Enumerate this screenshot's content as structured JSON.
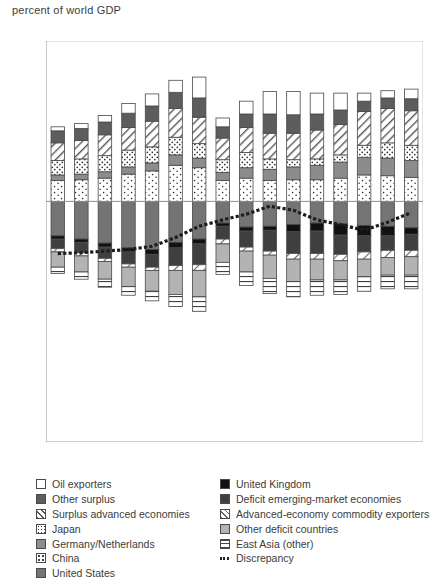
{
  "axis_title": "percent of world GDP",
  "legend": {
    "left": [
      {
        "label": "Oil exporters",
        "swatch": "oil-exporters-swatch",
        "cls": "sw-oil"
      },
      {
        "label": "Other surplus",
        "swatch": "other-surplus-swatch",
        "cls": "sw-othersurplus"
      },
      {
        "label": "Surplus advanced economies",
        "swatch": "surplus-advanced-economies-swatch",
        "cls": "sw-surpadv"
      },
      {
        "label": "Japan",
        "swatch": "japan-swatch",
        "cls": "sw-japan"
      },
      {
        "label": "Germany/Netherlands",
        "swatch": "germany-netherlands-swatch",
        "cls": "sw-germany"
      },
      {
        "label": "China",
        "swatch": "china-swatch",
        "cls": "sw-china"
      },
      {
        "label": "United States",
        "swatch": "united-states-swatch",
        "cls": "sw-us"
      }
    ],
    "right": [
      {
        "label": "United Kingdom",
        "swatch": "united-kingdom-swatch",
        "cls": "sw-uk"
      },
      {
        "label": "Deficit emerging-market economies",
        "swatch": "deficit-emerging-market-economies-swatch",
        "cls": "sw-deficitem"
      },
      {
        "label": "Advanced-economy commodity exporters",
        "swatch": "advanced-economy-commodity-exporters-swatch",
        "cls": "sw-advcomm"
      },
      {
        "label": "Other deficit countries",
        "swatch": "other-deficit-countries-swatch",
        "cls": "sw-otherdef"
      },
      {
        "label": "East Asia (other)",
        "swatch": "east-asia-other-swatch",
        "cls": "sw-eastasia"
      },
      {
        "label": "Discrepancy",
        "swatch": "discrepancy-swatch",
        "cls": "sw-disc"
      }
    ]
  },
  "chart_data": {
    "type": "bar",
    "stacked": true,
    "title": "",
    "xlabel": "",
    "ylabel": "percent of world GDP",
    "ylim": [
      -30,
      20
    ],
    "yticks": [
      20,
      10,
      0,
      -10,
      -20,
      -30
    ],
    "xticks": [
      2002,
      2005,
      2008,
      2011,
      2014,
      2017
    ],
    "grid": false,
    "legend_position": "below",
    "x": [
      2002,
      2003,
      2004,
      2005,
      2006,
      2007,
      2008,
      2009,
      2010,
      2011,
      2012,
      2013,
      2014,
      2015,
      2016,
      2017
    ],
    "series_positive": [
      {
        "name": "China",
        "key": "china",
        "values": [
          2.6,
          2.7,
          2.9,
          3.4,
          3.8,
          4.5,
          4.2,
          2.6,
          2.9,
          2.6,
          2.7,
          2.7,
          2.9,
          3.3,
          3.2,
          3.0
        ]
      },
      {
        "name": "Germany/Netherlands",
        "key": "germany",
        "values": [
          0.7,
          0.7,
          0.8,
          0.9,
          1.0,
          1.3,
          1.2,
          1.0,
          1.3,
          1.4,
          1.6,
          1.8,
          2.0,
          2.2,
          2.2,
          2.1
        ]
      },
      {
        "name": "Japan",
        "key": "japan",
        "values": [
          1.8,
          1.9,
          2.0,
          2.1,
          2.0,
          2.2,
          1.8,
          1.6,
          1.9,
          1.3,
          0.9,
          0.8,
          0.9,
          1.5,
          1.9,
          1.9
        ]
      },
      {
        "name": "Surplus advanced economies",
        "key": "surplus_advanced",
        "values": [
          2.2,
          2.3,
          2.6,
          2.8,
          3.2,
          3.6,
          3.3,
          2.7,
          3.1,
          3.2,
          3.3,
          3.6,
          3.8,
          4.2,
          4.3,
          4.3
        ]
      },
      {
        "name": "Other surplus",
        "key": "other_surplus",
        "values": [
          1.5,
          1.5,
          1.6,
          1.8,
          1.9,
          2.0,
          2.4,
          1.4,
          1.7,
          2.4,
          2.3,
          2.0,
          1.8,
          1.3,
          1.3,
          1.5
        ]
      },
      {
        "name": "Oil exporters",
        "key": "oil_exporters",
        "values": [
          0.5,
          0.6,
          0.8,
          1.2,
          1.5,
          1.5,
          2.6,
          1.1,
          1.6,
          2.8,
          2.9,
          2.6,
          2.1,
          1.0,
          0.9,
          1.2
        ]
      }
    ],
    "series_negative": [
      {
        "name": "United States",
        "key": "united_states",
        "values": [
          -4.3,
          -4.7,
          -5.2,
          -5.8,
          -6.0,
          -5.1,
          -4.7,
          -2.7,
          -3.2,
          -3.1,
          -2.9,
          -2.7,
          -2.8,
          -3.0,
          -3.1,
          -3.3
        ]
      },
      {
        "name": "United Kingdom",
        "key": "united_kingdom",
        "values": [
          -0.4,
          -0.4,
          -0.5,
          -0.5,
          -0.6,
          -0.7,
          -0.6,
          -0.4,
          -0.5,
          -0.5,
          -0.9,
          -1.0,
          -1.4,
          -1.3,
          -1.2,
          -0.8
        ]
      },
      {
        "name": "Deficit emerging-market economies",
        "key": "deficit_em",
        "values": [
          -1.2,
          -1.3,
          -1.4,
          -1.5,
          -1.6,
          -2.2,
          -2.6,
          -1.6,
          -2.0,
          -2.6,
          -2.7,
          -2.8,
          -2.4,
          -2.0,
          -1.8,
          -2.0
        ]
      },
      {
        "name": "Advanced-economy commodity exporters",
        "key": "adv_commodity",
        "values": [
          -0.4,
          -0.4,
          -0.4,
          -0.4,
          -0.4,
          -0.6,
          -0.7,
          -0.6,
          -0.5,
          -0.5,
          -0.7,
          -0.7,
          -0.8,
          -0.9,
          -0.9,
          -0.8
        ]
      },
      {
        "name": "Other deficit countries",
        "key": "other_deficit",
        "values": [
          -1.9,
          -2.0,
          -2.2,
          -2.4,
          -2.6,
          -3.0,
          -3.3,
          -2.3,
          -2.6,
          -2.9,
          -2.8,
          -2.6,
          -2.4,
          -2.2,
          -2.2,
          -2.3
        ]
      },
      {
        "name": "East Asia (other)",
        "key": "east_asia",
        "values": [
          -0.8,
          -0.9,
          -1.0,
          -1.1,
          -1.2,
          -1.5,
          -1.8,
          -1.5,
          -1.7,
          -1.9,
          -1.9,
          -1.9,
          -1.8,
          -1.8,
          -1.7,
          -1.7
        ]
      }
    ],
    "discrepancy": {
      "name": "Discrepancy",
      "values": [
        -6.5,
        -6.4,
        -6.2,
        -6.0,
        -5.6,
        -4.5,
        -3.1,
        -2.3,
        -1.6,
        -0.6,
        -1.1,
        -2.3,
        -2.9,
        -3.6,
        -2.6,
        -1.4
      ]
    }
  }
}
